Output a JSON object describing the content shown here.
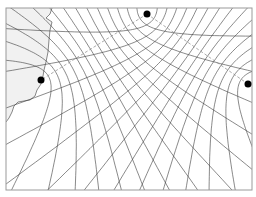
{
  "diagram": {
    "type": "hyperbolic-navigation-chart",
    "frame": {
      "x": 6,
      "y": 8,
      "width": 246,
      "height": 182
    },
    "colors": {
      "lines": "#3a3a3a",
      "frame": "#9a9a9a",
      "land": "#f1f1f1",
      "station": "#000000",
      "baseline": "#888888"
    },
    "stations": [
      {
        "id": "master",
        "role": "master",
        "x": 147,
        "y": 14
      },
      {
        "id": "slave-left",
        "role": "slave",
        "x": 41,
        "y": 80
      },
      {
        "id": "slave-right",
        "role": "slave",
        "x": 248,
        "y": 84
      }
    ],
    "baselines": [
      {
        "from": "master",
        "to": "slave-left"
      },
      {
        "from": "master",
        "to": "slave-right"
      }
    ],
    "hyperbola_families": [
      {
        "pair": [
          "master",
          "slave-left"
        ],
        "count": 15
      },
      {
        "pair": [
          "master",
          "slave-right"
        ],
        "count": 15
      }
    ],
    "coastline": [
      [
        52,
        8
      ],
      [
        50,
        14
      ],
      [
        46,
        18
      ],
      [
        52,
        22
      ],
      [
        50,
        30
      ],
      [
        49,
        40
      ],
      [
        48,
        52
      ],
      [
        46,
        62
      ],
      [
        44,
        70
      ],
      [
        43,
        76
      ],
      [
        41,
        84
      ],
      [
        37,
        90
      ],
      [
        35,
        96
      ],
      [
        30,
        100
      ],
      [
        24,
        101
      ],
      [
        18,
        102
      ],
      [
        14,
        106
      ],
      [
        12,
        112
      ],
      [
        9,
        118
      ],
      [
        6,
        122
      ]
    ]
  }
}
